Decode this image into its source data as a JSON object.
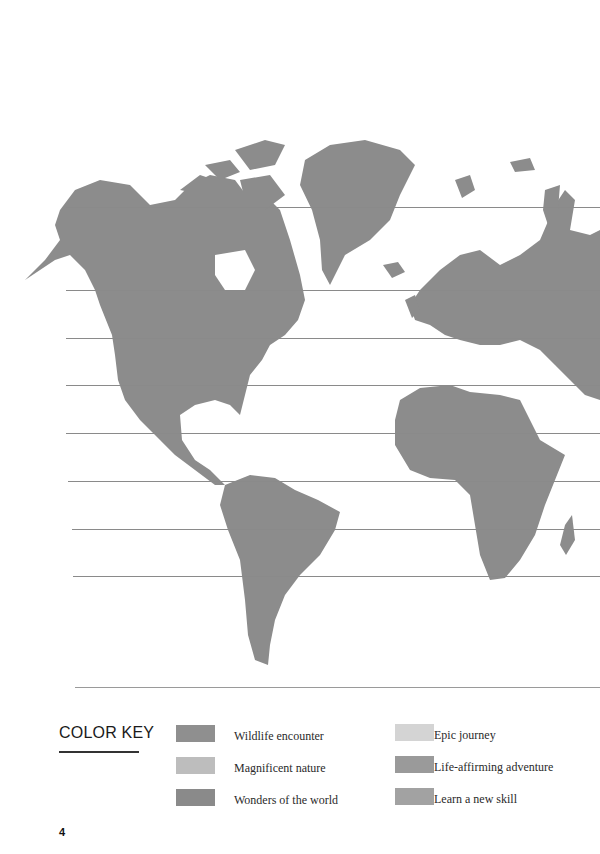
{
  "map": {
    "land_color": "#8c8c8c",
    "latitude_lines_y": [
      207,
      290,
      338,
      385,
      433,
      481,
      529,
      576,
      687
    ]
  },
  "color_key": {
    "title": "COLOR KEY",
    "items": [
      {
        "label": "Wildlife encounter",
        "color": "#8f8f8f"
      },
      {
        "label": "Magnificent nature",
        "color": "#bdbdbd"
      },
      {
        "label": "Wonders of the world",
        "color": "#8a8a8a"
      },
      {
        "label": "Epic journey",
        "color": "#d4d4d4"
      },
      {
        "label": "Life-affirming adventure",
        "color": "#9a9a9a"
      },
      {
        "label": "Learn a new skill",
        "color": "#a2a2a2"
      }
    ]
  },
  "page": {
    "number": "4"
  }
}
